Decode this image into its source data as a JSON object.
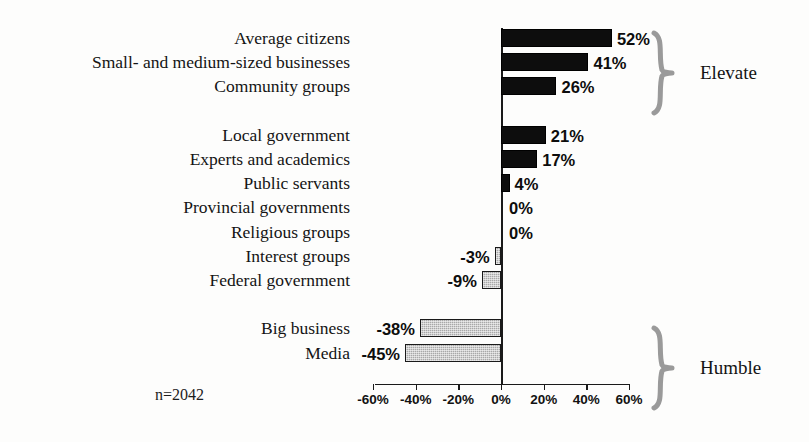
{
  "chart_data": {
    "type": "bar",
    "orientation": "horizontal",
    "title": "",
    "xlabel": "",
    "ylabel": "",
    "xlim": [
      -60,
      60
    ],
    "grid": false,
    "note": "n=2042",
    "axis_ticks": [
      "-60%",
      "-40%",
      "-20%",
      "0%",
      "20%",
      "40%",
      "60%"
    ],
    "axis_tick_values": [
      -60,
      -40,
      -20,
      0,
      20,
      40,
      60
    ],
    "categories": [
      "Average citizens",
      "Small- and medium-sized businesses",
      "Community groups",
      "Local government",
      "Experts and academics",
      "Public servants",
      "Provincial governments",
      "Religious groups",
      "Interest groups",
      "Federal government",
      "Big business",
      "Media"
    ],
    "values": [
      52,
      41,
      26,
      21,
      17,
      4,
      0,
      0,
      -3,
      -9,
      -38,
      -45
    ],
    "value_labels": [
      "52%",
      "41%",
      "26%",
      "21%",
      "17%",
      "4%",
      "0%",
      "0%",
      "-3%",
      "-9%",
      "-38%",
      "-45%"
    ],
    "rows": [
      {
        "label": "Average citizens",
        "value": 52,
        "value_label": "52%",
        "group": "elevate",
        "row": 0
      },
      {
        "label": "Small- and medium-sized businesses",
        "value": 41,
        "value_label": "41%",
        "group": "elevate",
        "row": 1
      },
      {
        "label": "Community groups",
        "value": 26,
        "value_label": "26%",
        "group": "elevate",
        "row": 2
      },
      {
        "label": "Local government",
        "value": 21,
        "value_label": "21%",
        "group": "middle",
        "row": 4
      },
      {
        "label": "Experts and academics",
        "value": 17,
        "value_label": "17%",
        "group": "middle",
        "row": 5
      },
      {
        "label": "Public servants",
        "value": 4,
        "value_label": "4%",
        "group": "middle",
        "row": 6
      },
      {
        "label": "Provincial governments",
        "value": 0,
        "value_label": "0%",
        "group": "middle",
        "row": 7
      },
      {
        "label": "Religious groups",
        "value": 0,
        "value_label": "0%",
        "group": "middle",
        "row": 8
      },
      {
        "label": "Interest groups",
        "value": -3,
        "value_label": "-3%",
        "group": "middle",
        "row": 9
      },
      {
        "label": "Federal government",
        "value": -9,
        "value_label": "-9%",
        "group": "middle",
        "row": 10
      },
      {
        "label": "Big business",
        "value": -38,
        "value_label": "-38%",
        "group": "humble",
        "row": 12
      },
      {
        "label": "Media",
        "value": -45,
        "value_label": "-45%",
        "group": "humble",
        "row": 13
      }
    ],
    "group_annotations": [
      {
        "name": "elevate",
        "label": "Elevate",
        "covers_rows": [
          0,
          2
        ]
      },
      {
        "name": "humble",
        "label": "Humble",
        "covers_rows": [
          12,
          13
        ]
      }
    ],
    "colors": {
      "positive_bar": "#0d0d0d",
      "negative_bar": "#a8a8a8",
      "negative_bar_border": "#1a1a1a",
      "axis": "#1a1a1a",
      "text": "#141414",
      "brace": "#9a9a9a",
      "background": "#fdfdfc"
    }
  }
}
